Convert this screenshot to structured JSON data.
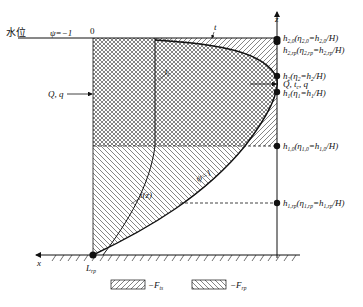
{
  "diagram": {
    "water_level_label": "水位",
    "psi_left_label": "ψ=−1",
    "zero_label": "0",
    "t_label": "t",
    "z_axis_label": "z",
    "x_axis_label": "x",
    "Q_q_label": "Q, q",
    "tc_label": "t",
    "tc_sub": "c",
    "tz_label": "t(z)",
    "psi_one_label": "ψ=1",
    "Lrp_label": "L",
    "Lrp_sub": "rp",
    "right_labels": [
      {
        "id": "h2_0",
        "main": "h",
        "sub": "2,0",
        "rest": "(η",
        "sub2": "2,0",
        "rest2": "=h",
        "sub3": "2,0",
        "rest3": "/H)"
      },
      {
        "id": "h2_rp",
        "main": "h",
        "sub": "2,rp",
        "rest": "(η",
        "sub2": "2,rp",
        "rest2": "=h",
        "sub3": "2,rp",
        "rest3": "/H)"
      },
      {
        "id": "h2",
        "main": "h",
        "sub": "2",
        "rest": "(η",
        "sub2": "2",
        "rest2": "=h",
        "sub3": "2",
        "rest3": "/H)"
      },
      {
        "id": "Q_tc_q",
        "text": "Q, t",
        "sub": "c",
        "rest": ", q"
      },
      {
        "id": "h1",
        "main": "h",
        "sub": "1",
        "rest": "(η",
        "sub2": "1",
        "rest2": "=h",
        "sub3": "1",
        "rest3": "/H)"
      },
      {
        "id": "h1_0",
        "main": "h",
        "sub": "1,0",
        "rest": "(η",
        "sub2": "1,0",
        "rest2": "=h",
        "sub3": "1,0",
        "rest3": "/H)"
      },
      {
        "id": "h1_rp",
        "main": "h",
        "sub": "1,rp",
        "rest": "(η",
        "sub2": "1,rp",
        "rest2": "=h",
        "sub3": "1,rp",
        "rest3": "/H)"
      }
    ],
    "legend": [
      {
        "symbol": "right-hatch",
        "label": "−F",
        "sub": "ts"
      },
      {
        "symbol": "left-hatch",
        "label": "−F",
        "sub": "rp"
      }
    ],
    "colors": {
      "line": "#111111",
      "background": "#ffffff",
      "hatch": "#444444"
    }
  }
}
